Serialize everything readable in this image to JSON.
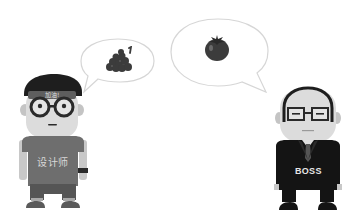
{
  "scene": {
    "background": "#ffffff",
    "palette": {
      "outline": "#d6d6d6",
      "dark": "#1e1e1e",
      "shirt": "#6e6e6e",
      "pants": "#5a5a5a",
      "skin": "#dcdcdc",
      "skin_shadow": "#c4c4c4",
      "fruit": "#3c3c3c",
      "suit": "#141414",
      "tie": "#555555"
    }
  },
  "designer": {
    "role": "designer",
    "headband_text": "加油!",
    "shirt_text": "设计师"
  },
  "boss": {
    "role": "boss",
    "suit_text": "BOSS"
  },
  "bubbles": [
    {
      "id": "designer-bubble",
      "content_icon": "grapes-icon"
    },
    {
      "id": "boss-bubble",
      "content_icon": "tomato-icon"
    }
  ]
}
